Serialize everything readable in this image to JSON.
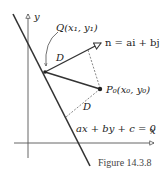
{
  "figure": {
    "caption": "Figure 14.3.8",
    "labels": {
      "y_axis": "y",
      "x_axis": "x",
      "point_q": "Q(x₁, y₁)",
      "normal_vector": "n = ai + bj",
      "point_p0": "P₀(x₀, y₀)",
      "distance_upper": "D",
      "distance_lower": "D",
      "line_equation": "ax + by + c = 0"
    },
    "colors": {
      "ink": "#333333",
      "background": "#ffffff"
    }
  }
}
